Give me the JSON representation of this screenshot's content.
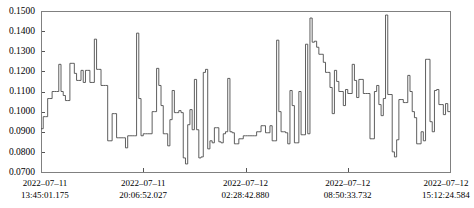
{
  "chart_data": {
    "type": "line",
    "title": "",
    "subtitle": "",
    "xlabel": "",
    "ylabel": "",
    "grid": false,
    "legend": "none",
    "line_style": "step-post",
    "line_color": "#4d4d4d",
    "frame_color": "#808080",
    "ylim": [
      0.07,
      0.15
    ],
    "ytick_values": [
      0.07,
      0.08,
      0.09,
      0.1,
      0.11,
      0.12,
      0.13,
      0.14,
      0.15
    ],
    "ytick_labels": [
      "0.0700",
      "0.0800",
      "0.0900",
      "0.1000",
      "0.1100",
      "0.1200",
      "0.1300",
      "0.1400",
      "0.1500"
    ],
    "xlim": [
      0,
      1
    ],
    "xtick_positions": [
      0.0,
      0.25,
      0.5,
      0.75,
      1.0
    ],
    "xtick_labels": [
      {
        "date": "2022–07–11",
        "time": "13:45:01.175"
      },
      {
        "date": "2022–07–11",
        "time": "20:06:52.027"
      },
      {
        "date": "2022–07–12",
        "time": "02:28:42.880"
      },
      {
        "date": "2022–07–12",
        "time": "08:50:33.732"
      },
      {
        "date": "2022–07–12",
        "time": "15:12:24.584"
      }
    ],
    "series": [
      {
        "name": "value",
        "values": [
          0.0915,
          0.0975,
          0.0975,
          0.1065,
          0.1065,
          0.11,
          0.11,
          0.11,
          0.1235,
          0.11,
          0.108,
          0.1055,
          0.1055,
          0.124,
          0.124,
          0.119,
          0.1155,
          0.1155,
          0.1205,
          0.1145,
          0.1205,
          0.1205,
          0.1145,
          0.1145,
          0.136,
          0.121,
          0.121,
          0.113,
          0.113,
          0.113,
          0.0855,
          0.0855,
          0.099,
          0.099,
          0.087,
          0.087,
          0.087,
          0.087,
          0.082,
          0.088,
          0.088,
          0.088,
          0.088,
          0.139,
          0.1065,
          0.088,
          0.089,
          0.089,
          0.089,
          0.089,
          0.1,
          0.1,
          0.1215,
          0.113,
          0.103,
          0.089,
          0.089,
          0.083,
          0.096,
          0.1105,
          0.0995,
          0.0995,
          0.1005,
          0.0995,
          0.077,
          0.074,
          0.0935,
          0.101,
          0.091,
          0.116,
          0.091,
          0.077,
          0.0775,
          0.1195,
          0.121,
          0.0815,
          0.0855,
          0.0845,
          0.092,
          0.092,
          0.085,
          0.0845,
          0.089,
          0.09,
          0.1165,
          0.09,
          0.0895,
          0.084,
          0.084,
          0.0865,
          0.0865,
          0.088,
          0.088,
          0.088,
          0.088,
          0.088,
          0.088,
          0.09,
          0.09,
          0.093,
          0.093,
          0.0895,
          0.0895,
          0.093,
          0.0855,
          0.0855,
          0.1355,
          0.1,
          0.09,
          0.09,
          0.0895,
          0.084,
          0.1105,
          0.103,
          0.0845,
          0.0845,
          0.11,
          0.0885,
          0.0885,
          0.1335,
          0.089,
          0.1465,
          0.1345,
          0.135,
          0.132,
          0.1285,
          0.1285,
          0.1245,
          0.1195,
          0.1195,
          0.112,
          0.099,
          0.1205,
          0.115,
          0.11,
          0.11,
          0.103,
          0.111,
          0.109,
          0.109,
          0.1235,
          0.1155,
          0.107,
          0.116,
          0.116,
          0.109,
          0.109,
          0.109,
          0.0865,
          0.0865,
          0.11,
          0.113,
          0.1035,
          0.098,
          0.1065,
          0.148,
          0.1085,
          0.1085,
          0.08,
          0.0775,
          0.086,
          0.106,
          0.106,
          0.1045,
          0.1045,
          0.118,
          0.11,
          0.1,
          0.097,
          0.084,
          0.084,
          0.09,
          0.0855,
          0.126,
          0.126,
          0.095,
          0.09,
          0.1105,
          0.111,
          0.1035,
          0.1035,
          0.0985,
          0.104,
          0.1
        ]
      }
    ]
  },
  "plot_area": {
    "left": 41,
    "top": 11,
    "right": 450,
    "bottom": 172
  }
}
